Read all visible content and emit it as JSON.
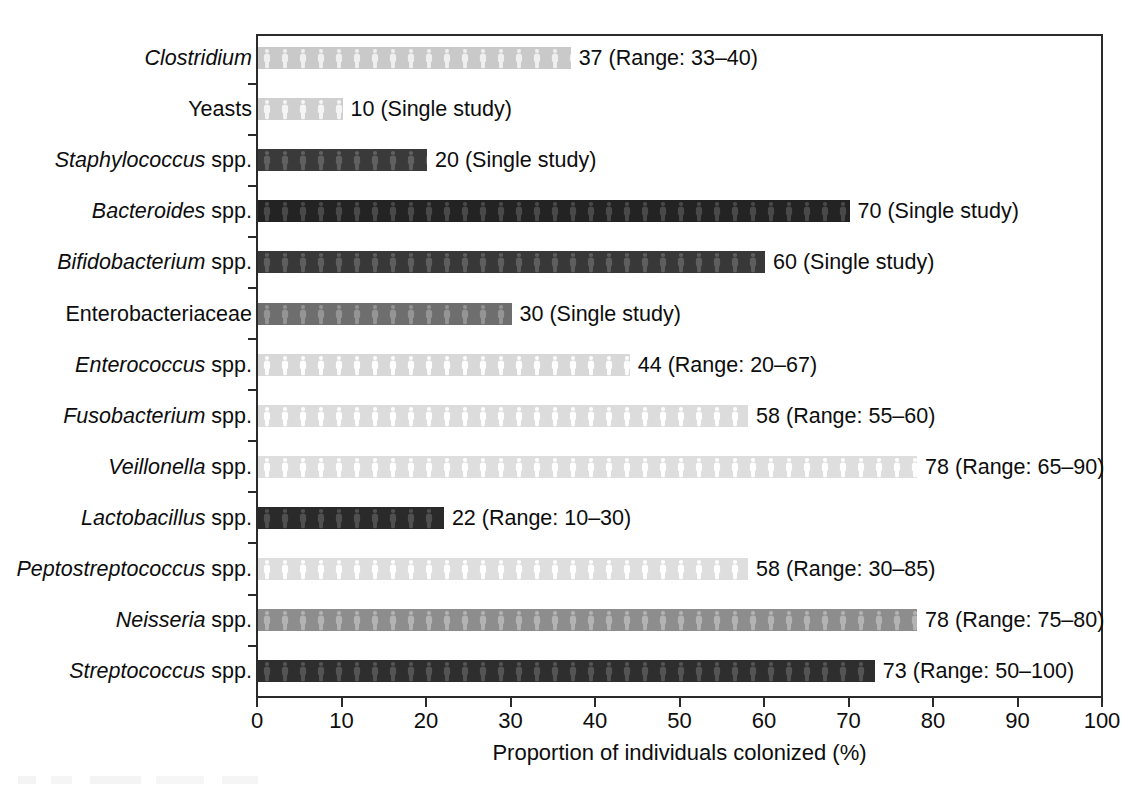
{
  "chart_data": {
    "type": "bar",
    "orientation": "horizontal",
    "title": "",
    "xlabel": "Proportion of individuals colonized (%)",
    "ylabel": "",
    "xlim": [
      0,
      100
    ],
    "xticks": [
      0,
      10,
      20,
      30,
      40,
      50,
      60,
      70,
      80,
      90,
      100
    ],
    "xtick_labels": [
      "0",
      "10",
      "20",
      "30",
      "40",
      "50",
      "60",
      "70",
      "80",
      "90",
      "100"
    ],
    "grid": false,
    "legend": null,
    "categories": [
      "Clostridium",
      "Yeasts",
      "Staphylococcus spp.",
      "Bacteroides spp.",
      "Bifidobacterium spp.",
      "Enterobacteriaceae",
      "Enterococcus spp.",
      "Fusobacterium spp.",
      "Veillonella spp.",
      "Lactobacillus spp.",
      "Peptostreptococcus spp.",
      "Neisseria spp.",
      "Streptococcus spp."
    ],
    "values": [
      37,
      10,
      20,
      70,
      60,
      30,
      44,
      58,
      78,
      22,
      58,
      78,
      73
    ],
    "annotations": [
      "37 (Range: 33–40)",
      "10 (Single study)",
      "20 (Single study)",
      "70 (Single study)",
      "60 (Single study)",
      "30 (Single study)",
      "44 (Range: 20–67)",
      "58 (Range: 55–60)",
      "78 (Range: 65–90)",
      "22 (Range: 10–30)",
      "58 (Range: 30–85)",
      "78 (Range: 75–80)",
      "73 (Range: 50–100)"
    ]
  },
  "rows": [
    {
      "genus": "Clostridium",
      "suffix": "",
      "value": 37,
      "annotation": "37 (Range: 33–40)",
      "shade": "light",
      "color": "#c9c9c9"
    },
    {
      "genus": "",
      "suffix": "Yeasts",
      "value": 10,
      "annotation": "10 (Single study)",
      "shade": "light",
      "color": "#cfcfcf"
    },
    {
      "genus": "Staphylococcus",
      "suffix": " spp.",
      "value": 20,
      "annotation": "20 (Single study)",
      "shade": "dark",
      "color": "#3a3a3a"
    },
    {
      "genus": "Bacteroides",
      "suffix": " spp.",
      "value": 70,
      "annotation": "70 (Single study)",
      "shade": "darkest",
      "color": "#232323"
    },
    {
      "genus": "Bifidobacterium",
      "suffix": " spp.",
      "value": 60,
      "annotation": "60 (Single study)",
      "shade": "dark",
      "color": "#383838"
    },
    {
      "genus": "",
      "suffix": "Enterobacteriaceae",
      "value": 30,
      "annotation": "30 (Single study)",
      "shade": "mid",
      "color": "#6e6e6e"
    },
    {
      "genus": "Enterococcus",
      "suffix": " spp.",
      "value": 44,
      "annotation": "44 (Range: 20–67)",
      "shade": "lighter",
      "color": "#d8d8d8"
    },
    {
      "genus": "Fusobacterium",
      "suffix": " spp.",
      "value": 58,
      "annotation": "58 (Range: 55–60)",
      "shade": "lighter",
      "color": "#dcdcdc"
    },
    {
      "genus": "Veillonella",
      "suffix": " spp.",
      "value": 78,
      "annotation": "78 (Range: 65–90)",
      "shade": "lighter",
      "color": "#dedede"
    },
    {
      "genus": "Lactobacillus",
      "suffix": " spp.",
      "value": 22,
      "annotation": "22 (Range: 10–30)",
      "shade": "darkest",
      "color": "#2a2a2a"
    },
    {
      "genus": "Peptostreptococcus",
      "suffix": " spp.",
      "value": 58,
      "annotation": "58 (Range: 30–85)",
      "shade": "lighter",
      "color": "#dedede"
    },
    {
      "genus": "Neisseria",
      "suffix": " spp.",
      "value": 78,
      "annotation": "78 (Range: 75–80)",
      "shade": "mid",
      "color": "#8d8d8d"
    },
    {
      "genus": "Streptococcus",
      "suffix": " spp.",
      "value": 73,
      "annotation": "73 (Range: 50–100)",
      "shade": "darkest",
      "color": "#2e2e2e"
    }
  ],
  "axis": {
    "title": "Proportion of individuals colonized (%)",
    "ticks": [
      "0",
      "10",
      "20",
      "30",
      "40",
      "50",
      "60",
      "70",
      "80",
      "90",
      "100"
    ]
  },
  "colors": {
    "frame": "#2b2b2b",
    "text": "#0d0d0d",
    "background": "#ffffff"
  }
}
